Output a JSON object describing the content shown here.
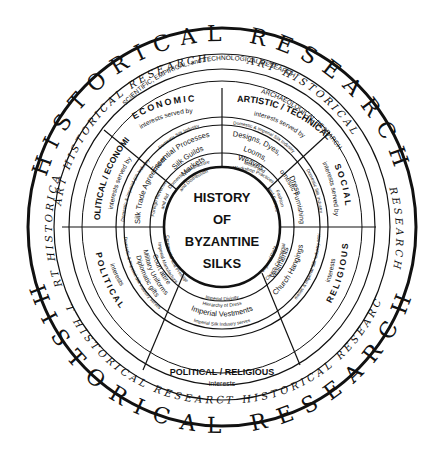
{
  "center": {
    "lines": [
      "HISTORY",
      "OF",
      "BYZANTINE",
      "SILKS"
    ]
  },
  "outer_ring": {
    "top": "HISTORICAL   RESEARCH",
    "bottom": "HISTORICAL   RESEARCH"
  },
  "art_ring": {
    "top_left": "ART HISTORICAL RESEARCH",
    "top_right": "ART HISTORICAL",
    "right": "RESEARCH",
    "left": "ART HISTORICAL",
    "bottom_left": "ART HISTORICAL RESEARCH",
    "bottom_right": "ART HISTORICAL RESEARCH"
  },
  "research_ring": {
    "left": "SCIENTIFIC, EMPIRICAL, and TECHNOLOGICAL RESEARCH",
    "right": "ARCHAEOLOGICAL RESEARCH"
  },
  "sectors": [
    {
      "id": "economic",
      "title": "ECONOMIC",
      "subtitle": "interests served by",
      "served": "Domestic Silk Industry",
      "items": [
        "Essential Processes",
        "Silk Guilds",
        "Markets"
      ],
      "inner": [
        "Domestic Manufacture",
        "and Distribution"
      ]
    },
    {
      "id": "artistic",
      "title": "ARTISTIC / TECHNICAL",
      "subtitle": "interests served by",
      "served": "Domestic & Imperial Silk Industry",
      "items": [
        "Designs, Dyes,",
        "Looms,",
        "Weaves"
      ],
      "inner": [
        "Motifs and",
        "Workshop Practices"
      ]
    },
    {
      "id": "social",
      "title": "SOCIAL",
      "subtitle": "interests served by",
      "served": "Domestic Silk Industry",
      "items": [
        "Dress",
        "Domestic Furnishings"
      ],
      "inner": [
        "Fashion",
        "and Fabrics"
      ]
    },
    {
      "id": "religious",
      "title": "RELIGIOUS",
      "subtitle": "interests",
      "served": "Domestic & Imperial Silk Industry serves",
      "items": [
        "Vestments",
        "Church Hangings"
      ],
      "inner": [
        "Imperial Piety",
        "Church Ceremonial"
      ]
    },
    {
      "id": "political-religious",
      "title": "POLITICAL / RELIGIOUS",
      "subtitle": "interests",
      "served": "Imperial Silk Industry serves",
      "items": [
        "Imperial Vestments"
      ],
      "inner": [
        "Imperial Divinity",
        "Hierarchy of Dress"
      ]
    },
    {
      "id": "political",
      "title": "POLITICAL",
      "subtitle": "interests",
      "served": "Domestic & Imperial Silk Industry serves",
      "items": [
        "Court attire",
        "Military Uniforms",
        "Diplomatic gifts"
      ],
      "inner": [
        "Ceremonial and Prestige",
        "Imperial Manufacture"
      ]
    },
    {
      "id": "political-economic",
      "title": "POLITICAL / ECONOMIC",
      "subtitle": "interests served by",
      "served": "Domestic & Imperial Silk Industry",
      "items": [
        "Silk Trade Agreements"
      ],
      "inner": [
        "Foreign Revenue",
        "and Aid"
      ]
    }
  ],
  "colors": {
    "ink": "#111111",
    "paper": "#ffffff"
  }
}
